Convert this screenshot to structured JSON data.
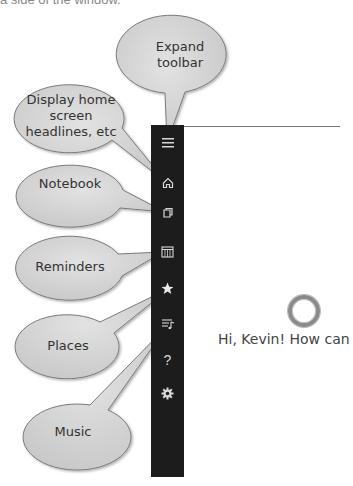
{
  "header": {
    "partial_text": "a side of the window."
  },
  "callouts": [
    {
      "id": "expand-toolbar",
      "label": "Expand toolbar",
      "line1": "Expand",
      "line2": "toolbar"
    },
    {
      "id": "home",
      "label": "Display home screen headlines, etc",
      "line1": "Display home",
      "line2": "screen",
      "line3": "headlines, etc"
    },
    {
      "id": "notebook",
      "label": "Notebook"
    },
    {
      "id": "reminders",
      "label": "Reminders"
    },
    {
      "id": "places",
      "label": "Places"
    },
    {
      "id": "music",
      "label": "Music"
    }
  ],
  "sidebar": {
    "background": "#1c1c1c",
    "items": [
      {
        "name": "menu",
        "icon": "hamburger-icon"
      },
      {
        "name": "home",
        "icon": "home-icon"
      },
      {
        "name": "notebook",
        "icon": "notebook-icon"
      },
      {
        "name": "reminders",
        "icon": "reminders-icon"
      },
      {
        "name": "places",
        "icon": "star-icon"
      },
      {
        "name": "music",
        "icon": "music-icon"
      },
      {
        "name": "help",
        "icon": "help-icon",
        "glyph": "?"
      },
      {
        "name": "settings",
        "icon": "gear-icon"
      }
    ]
  },
  "main": {
    "greeting": "Hi, Kevin! How can"
  },
  "colors": {
    "bubble_fill": "#d4d4d4",
    "bubble_stroke": "#8a8a8a",
    "sidebar": "#1c1c1c",
    "icon": "#d8d8d8"
  }
}
